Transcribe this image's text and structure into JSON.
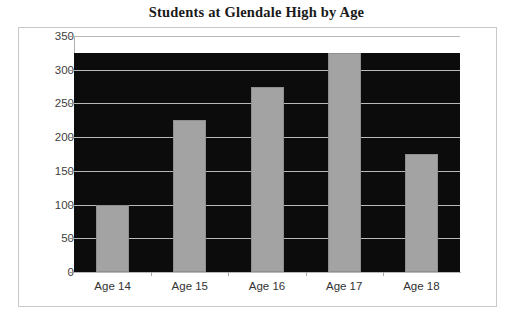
{
  "chart_data": {
    "type": "bar",
    "title": "Students at Glendale High by Age",
    "xlabel": "",
    "ylabel": "",
    "categories": [
      "Age 14",
      "Age 15",
      "Age 16",
      "Age 17",
      "Age 18"
    ],
    "values": [
      100,
      225,
      275,
      325,
      175
    ],
    "ylim": [
      0,
      350
    ],
    "ytick_labels": [
      "0",
      "50",
      "100",
      "150",
      "200",
      "250",
      "300",
      "350"
    ],
    "ytick_values": [
      0,
      50,
      100,
      150,
      200,
      250,
      300,
      350
    ],
    "grid": true,
    "legend": "none",
    "colors": {
      "bar_fill": "#a3a3a3",
      "bar_stroke": "#8f8f8f",
      "plot_background": "#0c0c0c",
      "gridline": "#b8b8b8",
      "axis_line": "#b0b0b0",
      "frame_border": "#c9c9c9",
      "title_text": "#1a1a1a",
      "tick_text": "#404040",
      "page_background": "#ffffff"
    }
  }
}
